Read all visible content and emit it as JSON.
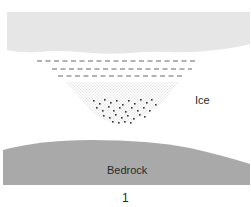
{
  "diagram": {
    "labels": {
      "ice": "Ice",
      "bedrock": "Bedrock",
      "figure_number": "1"
    },
    "colors": {
      "ice_slab": "#e6e6e6",
      "bedrock": "#a9a9a9",
      "dashes": "#555555",
      "fine_stipple": "#9a9a9a",
      "coarse_dots": "#333333",
      "background": "#ffffff"
    },
    "elements": [
      "upper-ice-slab",
      "dashed-layering-lines",
      "fine-stipple-debris",
      "coarse-debris-particles",
      "bedrock"
    ]
  }
}
